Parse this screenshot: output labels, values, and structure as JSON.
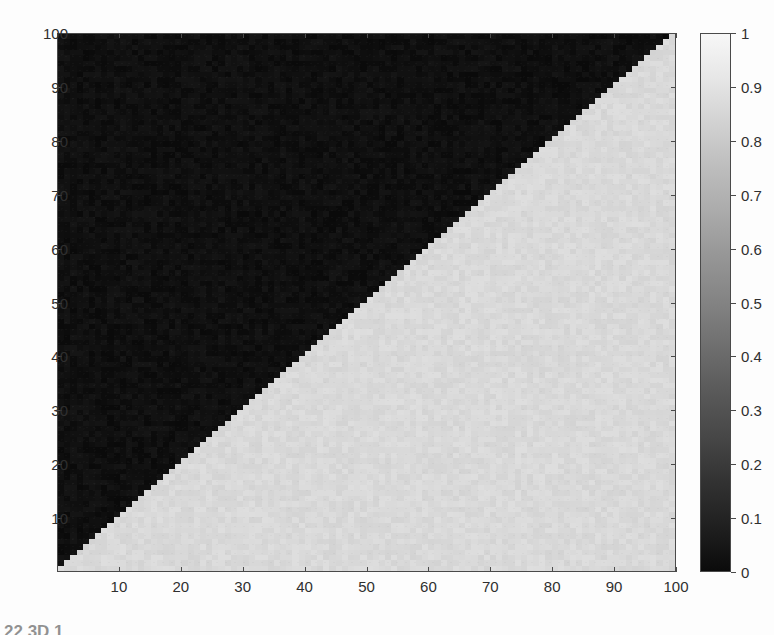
{
  "figure": {
    "kind": "pseudocolor-image-plot",
    "caption_fragment": "22  3D         1"
  },
  "chart_data": {
    "type": "heatmap",
    "title": "",
    "xlabel": "",
    "ylabel": "",
    "xlim": [
      0,
      100
    ],
    "ylim": [
      0,
      100
    ],
    "grid": false,
    "x_ticks": [
      10,
      20,
      30,
      40,
      50,
      60,
      70,
      80,
      90,
      100
    ],
    "y_ticks": [
      10,
      20,
      30,
      40,
      50,
      60,
      70,
      80,
      90,
      100
    ],
    "x_tick_labels": [
      "10",
      "20",
      "30",
      "40",
      "50",
      "60",
      "70",
      "80",
      "90",
      "100"
    ],
    "y_tick_labels": [
      "10",
      "20",
      "30",
      "40",
      "50",
      "60",
      "70",
      "80",
      "90",
      "100"
    ],
    "colormap": "gray",
    "grid_size": [
      100,
      100
    ],
    "value_low": 0.06,
    "value_high": 0.85,
    "colorbar": {
      "position": "right",
      "vmin": 0,
      "vmax": 1,
      "ticks": [
        0,
        0.1,
        0.2,
        0.3,
        0.4,
        0.5,
        0.6,
        0.7,
        0.8,
        0.9,
        1
      ],
      "tick_labels": [
        "0",
        "0.1",
        "0.2",
        "0.3",
        "0.4",
        "0.5",
        "0.6",
        "0.7",
        "0.8",
        "0.9",
        "1"
      ]
    },
    "colors": {
      "dark_region": "#151515",
      "light_region": "#d9d9d9",
      "axis_line": "#4a4a4a",
      "background": "#fdfdfd",
      "text": "#2f2f2f"
    }
  }
}
